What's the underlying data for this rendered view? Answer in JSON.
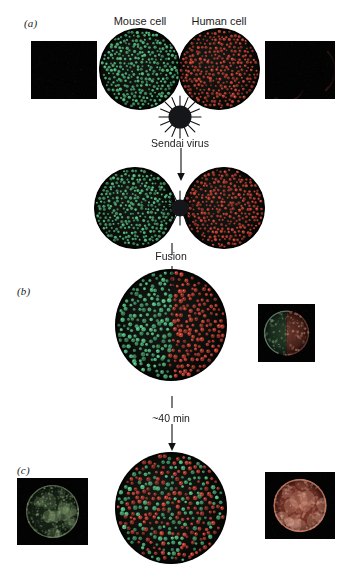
{
  "figure": {
    "background_color": "#ffffff"
  },
  "panels": [
    {
      "id": "a",
      "letter": "(a)"
    },
    {
      "id": "b",
      "letter": "(b)"
    },
    {
      "id": "c",
      "letter": "(c)"
    }
  ],
  "labels": {
    "mouse_cell": "Mouse cell",
    "human_cell": "Human cell",
    "sendai_virus": "Sendai virus",
    "fusion": "Fusion",
    "time_elapsed": "~40 min"
  },
  "colors": {
    "mouse_protein_green": "#4fb87a",
    "human_protein_red": "#c0392b",
    "cell_body": "#0d0f0d",
    "cell_edge": "#000000",
    "virus_body": "#14161a",
    "micrograph_background": "#030303",
    "arrow": "#111111",
    "text": "#1c1c1c"
  },
  "schematic_cells": [
    {
      "name": "mouse-cell-schematic",
      "panel": "a",
      "cx": 140,
      "cy": 69,
      "r": 41,
      "green_density": 1.0,
      "red_density": 0.0,
      "split": "none"
    },
    {
      "name": "human-cell-schematic",
      "panel": "a",
      "cx": 219,
      "cy": 69,
      "r": 41,
      "green_density": 0.0,
      "red_density": 1.0,
      "split": "none"
    },
    {
      "name": "mouse-cell-attached",
      "panel": "a",
      "cx": 135,
      "cy": 208,
      "r": 41,
      "green_density": 1.0,
      "red_density": 0.0,
      "split": "none"
    },
    {
      "name": "human-cell-attached",
      "panel": "a",
      "cx": 224,
      "cy": 208,
      "r": 41,
      "green_density": 0.0,
      "red_density": 1.0,
      "split": "none"
    },
    {
      "name": "heterokaryon-unmixed",
      "panel": "b",
      "cx": 171,
      "cy": 325,
      "r": 56,
      "green_density": 1.0,
      "red_density": 1.0,
      "split": "half"
    },
    {
      "name": "heterokaryon-mixed",
      "panel": "c",
      "cx": 171,
      "cy": 508,
      "r": 56,
      "green_density": 1.0,
      "red_density": 1.0,
      "split": "mixed"
    }
  ],
  "virus_particles": [
    {
      "name": "sendai-virus-free",
      "cx": 180,
      "cy": 117,
      "r": 12,
      "spikes": 16
    },
    {
      "name": "sendai-virus-bridging",
      "cx": 180,
      "cy": 208,
      "r": 9,
      "spikes": 14
    }
  ],
  "micrographs": [
    {
      "name": "micrograph-mouse-antihuman",
      "panel": "a",
      "x": 31,
      "y": 41,
      "w": 66,
      "h": 58,
      "kind": "blank",
      "tint": "#050505",
      "description": "Mouse cell, anti-human antibody: no fluorescence"
    },
    {
      "name": "micrograph-human-antihuman",
      "panel": "a",
      "x": 265,
      "y": 41,
      "w": 70,
      "h": 58,
      "kind": "red-crescent",
      "tint": "#8c3a30",
      "description": "Human cell, anti-human antibody: red rim fluorescence"
    },
    {
      "name": "micrograph-heterokaryon-halfred",
      "panel": "b",
      "x": 258,
      "y": 304,
      "w": 57,
      "h": 58,
      "kind": "half-green-red",
      "tint": "#9a4a3c",
      "description": "Heterokaryon immediately after fusion: green and red unmixed"
    },
    {
      "name": "micrograph-heterokaryon-green",
      "panel": "c",
      "x": 17,
      "y": 478,
      "w": 71,
      "h": 67,
      "kind": "green-cell",
      "tint": "#5d7a4a",
      "description": "Heterokaryon after 40 min, anti-mouse antibody: green over whole surface"
    },
    {
      "name": "micrograph-heterokaryon-red",
      "panel": "c",
      "x": 265,
      "y": 472,
      "w": 70,
      "h": 67,
      "kind": "red-cell",
      "tint": "#b0513f",
      "description": "Heterokaryon after 40 min, anti-human antibody: red over whole surface"
    }
  ],
  "connectors": [
    {
      "name": "arrow-virus-to-fusion",
      "x1": 180,
      "y1": 152,
      "x2": 180,
      "y2": 178,
      "arrowhead": true
    },
    {
      "name": "arrow-fusion-to-heterokaryon",
      "x1": 180,
      "y1": 244,
      "x2": 180,
      "y2": 262,
      "arrowhead": false
    },
    {
      "name": "arrow-fusion-label-down",
      "x1": 171,
      "y1": 262,
      "x2": 171,
      "y2": 292,
      "arrowhead": true
    },
    {
      "name": "arrow-time-up",
      "x1": 171,
      "y1": 398,
      "x2": 171,
      "y2": 414,
      "arrowhead": false
    },
    {
      "name": "arrow-time-down",
      "x1": 171,
      "y1": 428,
      "x2": 171,
      "y2": 450,
      "arrowhead": true
    }
  ],
  "text_positions": {
    "panel_a_letter": {
      "x": 24,
      "y": 17
    },
    "panel_b_letter": {
      "x": 17,
      "y": 285
    },
    "panel_c_letter": {
      "x": 17,
      "y": 464
    },
    "mouse_cell": {
      "x": 140,
      "y": 15
    },
    "human_cell": {
      "x": 219,
      "y": 15
    },
    "sendai_virus": {
      "x": 180,
      "y": 137
    },
    "fusion": {
      "x": 171,
      "y": 250
    },
    "time_elapsed": {
      "x": 171,
      "y": 416
    }
  }
}
